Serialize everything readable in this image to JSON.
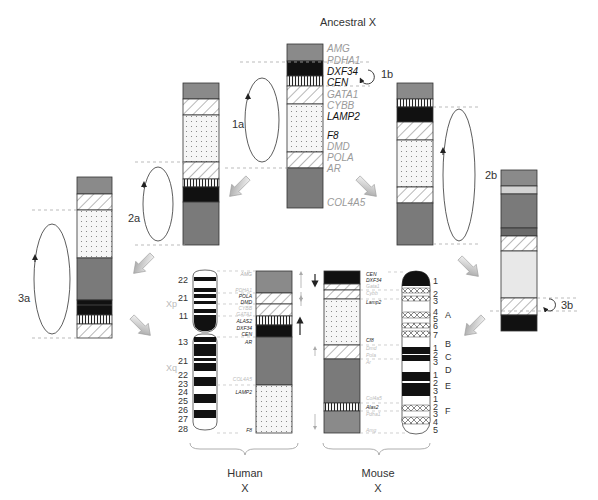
{
  "title": "Ancestral X",
  "colors": {
    "dark_gray": "#7a7a7a",
    "mid_gray": "#8e8e8e",
    "black": "#111111",
    "light_gray": "#e8e8e8",
    "pale_gray": "#d4d4d4",
    "gene_gray": "#9a9a9a",
    "gene_dark": "#111111"
  },
  "ancestral": {
    "genes": [
      {
        "name": "AMG",
        "dark": false
      },
      {
        "name": "PDHA1",
        "dark": false
      },
      {
        "name": "DXF34",
        "dark": true
      },
      {
        "name": "CEN",
        "dark": true
      },
      {
        "name": "GATA1",
        "dark": false
      },
      {
        "name": "CYBB",
        "dark": false
      },
      {
        "name": "LAMP2",
        "dark": true
      },
      {
        "name": "F8",
        "dark": true
      },
      {
        "name": "DMD",
        "dark": false
      },
      {
        "name": "POLA",
        "dark": false
      },
      {
        "name": "AR",
        "dark": false
      },
      {
        "name": "COL4A5",
        "dark": false
      }
    ]
  },
  "step_labels": {
    "s1a": "1a",
    "s1b": "1b",
    "s2a": "2a",
    "s2b": "2b",
    "s3a": "3a",
    "s3b": "3b"
  },
  "human": {
    "title_line1": "Human",
    "title_line2": "X",
    "arm_p": "Xp",
    "arm_q": "Xq",
    "bands": [
      "22",
      "21",
      "11",
      "13",
      "21",
      "22",
      "23",
      "24",
      "25",
      "26",
      "27",
      "28"
    ],
    "genes": [
      "AMG",
      "PDHA1",
      "POLA",
      "DMD",
      "CYBB",
      "GATA1",
      "ALAS2",
      "DXF34",
      "CEN",
      "AR",
      "COL4A5",
      "LAMP2",
      "F8"
    ]
  },
  "mouse": {
    "title_line1": "Mouse",
    "title_line2": "X",
    "band_numbers": [
      "1",
      "2",
      "3",
      "4",
      "5",
      "6",
      "7",
      "1",
      "2",
      "3",
      "1",
      "2",
      "3",
      "1",
      "2",
      "3",
      "4",
      "5"
    ],
    "band_letters": [
      "A",
      "B",
      "C",
      "D",
      "E",
      "F"
    ],
    "genes": [
      "CEN",
      "DXF34",
      "Gata1",
      "Cybb",
      "Lamp2",
      "Cf8",
      "Dmd",
      "Pola",
      "Ar",
      "Col4a5",
      "Alas2",
      "Pdha1",
      "Amg"
    ]
  }
}
